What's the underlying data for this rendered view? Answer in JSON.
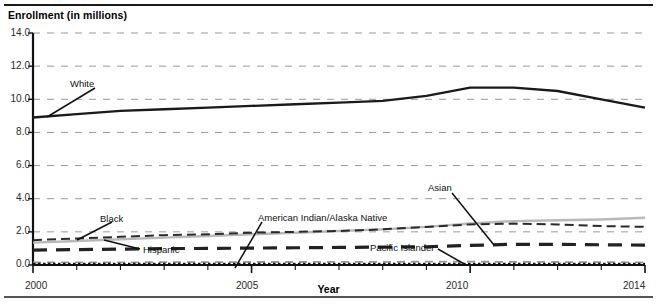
{
  "axis_titles": {
    "y": "Enrollment (in millions)",
    "x": "Year"
  },
  "ticks": {
    "y": [
      "14.0",
      "12.0",
      "10.0",
      "8.0",
      "6.0",
      "4.0",
      "2.0",
      "0.0"
    ],
    "x": [
      "2000",
      "2005",
      "2010",
      "2014"
    ]
  },
  "annotations": {
    "white": "White",
    "black": "Black",
    "hispanic": "Hispanic",
    "american_indian": "American Indian/Alaska Native",
    "asian": "Asian",
    "pacific_islander": "Pacific Islander"
  },
  "colors": {
    "white_line": "#1a1a1a",
    "black_line": "#2b2b2b",
    "hispanic_line": "#b9b9b9",
    "asian_line": "#222222",
    "american_indian_line": "#9a9a9a",
    "pacific_islander_line": "#111111",
    "grid": "#9a9a9a",
    "axis": "#111111"
  },
  "chart_data": {
    "type": "line",
    "title": "",
    "xlabel": "Year",
    "ylabel": "Enrollment (in millions)",
    "xlim": [
      2000,
      2014
    ],
    "ylim": [
      0.0,
      14.0
    ],
    "yticks": [
      0.0,
      2.0,
      4.0,
      6.0,
      8.0,
      10.0,
      12.0,
      14.0
    ],
    "xticks": [
      2000,
      2005,
      2010,
      2014
    ],
    "grid": "horizontal-dashed",
    "legend": "inline-annotations",
    "x": [
      2000,
      2001,
      2002,
      2003,
      2004,
      2005,
      2006,
      2007,
      2008,
      2009,
      2010,
      2011,
      2012,
      2013,
      2014
    ],
    "series": [
      {
        "name": "White",
        "style": "solid-thick",
        "color": "#1a1a1a",
        "values": [
          8.9,
          9.1,
          9.3,
          9.4,
          9.5,
          9.6,
          9.7,
          9.8,
          9.9,
          10.2,
          10.7,
          10.7,
          10.5,
          10.0,
          9.5
        ]
      },
      {
        "name": "Black",
        "style": "dashed-medium",
        "color": "#2b2b2b",
        "values": [
          1.5,
          1.6,
          1.7,
          1.8,
          1.85,
          1.95,
          2.0,
          2.05,
          2.15,
          2.3,
          2.45,
          2.5,
          2.45,
          2.35,
          2.3
        ]
      },
      {
        "name": "Hispanic",
        "style": "solid-gray",
        "color": "#b9b9b9",
        "values": [
          1.35,
          1.45,
          1.55,
          1.65,
          1.75,
          1.85,
          1.95,
          2.05,
          2.15,
          2.3,
          2.5,
          2.65,
          2.7,
          2.75,
          2.85
        ]
      },
      {
        "name": "Asian",
        "style": "dashed-thick",
        "color": "#222222",
        "values": [
          0.9,
          0.93,
          0.96,
          0.99,
          1.0,
          1.02,
          1.04,
          1.06,
          1.08,
          1.1,
          1.18,
          1.25,
          1.25,
          1.22,
          1.2
        ]
      },
      {
        "name": "American Indian/Alaska Native",
        "style": "dashed-light",
        "color": "#9a9a9a",
        "values": [
          0.15,
          0.16,
          0.16,
          0.17,
          0.17,
          0.18,
          0.18,
          0.19,
          0.19,
          0.2,
          0.2,
          0.19,
          0.18,
          0.17,
          0.16
        ]
      },
      {
        "name": "Pacific Islander",
        "style": "dotted",
        "color": "#111111",
        "values": [
          0.05,
          0.05,
          0.05,
          0.05,
          0.05,
          0.06,
          0.06,
          0.06,
          0.06,
          0.06,
          0.06,
          0.06,
          0.06,
          0.06,
          0.06
        ]
      }
    ]
  }
}
